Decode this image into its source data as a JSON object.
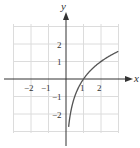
{
  "chart_data": {
    "type": "line",
    "title": "",
    "xlabel": "x",
    "ylabel": "y",
    "xlim": [
      -3,
      3
    ],
    "ylim": [
      -3,
      3
    ],
    "grid": true,
    "x_tick_labels": [
      "-2",
      "-1",
      "1",
      "2"
    ],
    "y_tick_labels": [
      "2",
      "1",
      "-1",
      "-2"
    ],
    "series": [
      {
        "name": "y = log2(x)",
        "x": [
          0.15,
          0.25,
          0.5,
          1,
          1.5,
          2,
          2.5,
          3
        ],
        "y": [
          -2.74,
          -2,
          -1,
          0,
          0.58,
          1,
          1.32,
          1.58
        ]
      }
    ],
    "colors": {
      "curve": "#555555",
      "grid": "#d8d8d8",
      "axis": "#333333"
    }
  },
  "labels": {
    "x_axis": "x",
    "y_axis": "y",
    "xt_m2": "−2",
    "xt_m1": "−1",
    "xt_1": "1",
    "xt_2": "2",
    "yt_2": "2",
    "yt_1": "1",
    "yt_m1": "−1",
    "yt_m2": "−2"
  }
}
